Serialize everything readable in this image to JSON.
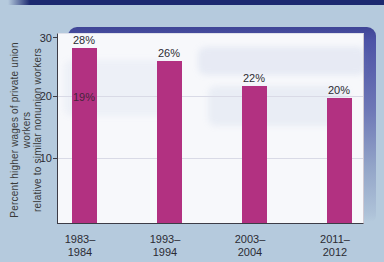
{
  "colors": {
    "background": "#b5cadd",
    "top_strip": "#1c2970",
    "panel_top": "#4a50a0",
    "panel_fade": "#aec2d8",
    "plot_bg": "#f7f8fb",
    "axis": "#3c3c46",
    "gridline": "#d9dae6",
    "bar": "#b23181",
    "text": "#2b2b33"
  },
  "chart_data": {
    "type": "bar",
    "title": "",
    "xlabel": "",
    "ylabel": "Percent higher wages of private union workers relative to similar nonunion workers",
    "ylabel_lines": [
      "Percent higher wages of private union workers",
      "relative to similar nonunion workers"
    ],
    "categories": [
      "1983–1984",
      "1993–1994",
      "2003–2004",
      "2011–2012"
    ],
    "categories_lines": [
      [
        "1983–",
        "1984"
      ],
      [
        "1993–",
        "1994"
      ],
      [
        "2003–",
        "2004"
      ],
      [
        "2011–",
        "2012"
      ]
    ],
    "values": [
      28,
      26,
      22,
      20
    ],
    "value_labels": [
      "28%",
      "26%",
      "22%",
      "20%"
    ],
    "showthrough_label": "19%",
    "ylim": [
      0,
      30
    ],
    "yticks": [
      30,
      20,
      10
    ],
    "ytick_labels": [
      "30",
      "20",
      "10"
    ],
    "grid": true,
    "legend": "none",
    "bar_color": "#b23181"
  }
}
